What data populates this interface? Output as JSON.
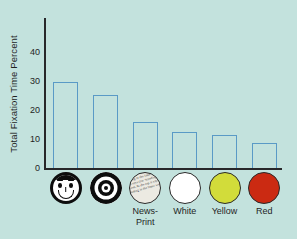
{
  "chart_data": {
    "type": "bar",
    "title": "",
    "xlabel": "",
    "ylabel": "Total Fixation Time Percent",
    "ylim": [
      0,
      40
    ],
    "yticks": [
      0,
      10,
      20,
      30,
      40
    ],
    "grid": false,
    "legend": "none",
    "categories": [
      "",
      "",
      "News-\nPrint",
      "White",
      "Yellow",
      "Red"
    ],
    "category_icons": [
      "face-icon",
      "bullseye-icon",
      "newsprint-icon",
      "white-disc-icon",
      "yellow-disc-icon",
      "red-disc-icon"
    ],
    "values": [
      29.5,
      25.3,
      16.0,
      12.5,
      11.5,
      8.5
    ],
    "series": [
      {
        "name": "Total Fixation Time Percent",
        "values": [
          29.5,
          25.3,
          16.0,
          12.5,
          11.5,
          8.5
        ]
      }
    ]
  },
  "axis": {
    "y_title": "Total Fixation Time Percent",
    "ticks": [
      {
        "label": "40",
        "value": 40
      },
      {
        "label": "30",
        "value": 30
      },
      {
        "label": "20",
        "value": 20
      },
      {
        "label": "10",
        "value": 10
      },
      {
        "label": "0",
        "value": 0
      }
    ]
  },
  "categories": [
    {
      "icon": "face-icon",
      "label": ""
    },
    {
      "icon": "bullseye-icon",
      "label": ""
    },
    {
      "icon": "newsprint-icon",
      "label": "News-\nPrint"
    },
    {
      "icon": "white-disc-icon",
      "label": "White"
    },
    {
      "icon": "yellow-disc-icon",
      "label": "Yellow"
    },
    {
      "icon": "red-disc-icon",
      "label": "Red"
    }
  ],
  "newsprint_text": "At the top it says Our Standing in the latter week",
  "colors": {
    "background": "#c3e2dd",
    "bar_stroke": "#5a9ac6",
    "axis": "#28282a",
    "text": "#1f1f1f",
    "white_disc": "#ffffff",
    "yellow_disc": "#d2dc3a",
    "red_disc": "#cb2a12",
    "ink": "#0d0d0d",
    "newsprint_paper": "#eceae2"
  }
}
